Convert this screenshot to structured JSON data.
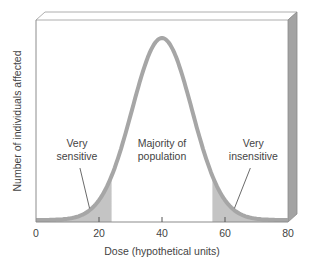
{
  "chart_data": {
    "type": "line",
    "title": "",
    "xlabel": "Dose (hypothetical units)",
    "ylabel": "Number of individuals affected",
    "xlim": [
      0,
      80
    ],
    "x_ticks": [
      0,
      20,
      40,
      60,
      80
    ],
    "x_tick_labels": [
      "0",
      "20",
      "40",
      "60",
      "80"
    ],
    "grid": false,
    "legend": null,
    "series": [
      {
        "name": "Population response distribution",
        "distribution": "normal",
        "mean": 40,
        "sd": 9.5,
        "relative_peak": 1.0
      }
    ],
    "shaded_regions": [
      {
        "name": "Very sensitive",
        "x_from": 0,
        "x_to": 24
      },
      {
        "name": "Very insensitive",
        "x_from": 56,
        "x_to": 80
      }
    ],
    "annotations": [
      {
        "lines": [
          "Very",
          "sensitive"
        ],
        "x": 13,
        "points_to": 17
      },
      {
        "lines": [
          "Majority of",
          "population"
        ],
        "x": 40
      },
      {
        "lines": [
          "Very",
          "insensitive"
        ],
        "x": 69,
        "points_to": 63
      }
    ]
  },
  "colors": {
    "curve": "#a6a6a6",
    "shade": "#c4c4c4",
    "frame": "#8c8c8c",
    "side_panel": "#a3a3a3",
    "text": "#444444"
  }
}
